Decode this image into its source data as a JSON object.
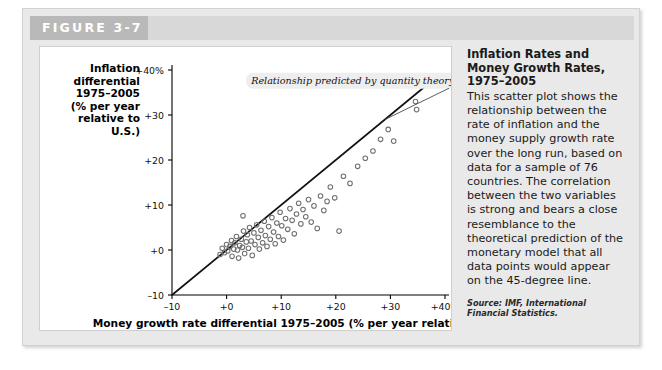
{
  "figure": {
    "tab_label": "FIGURE 3-7"
  },
  "sidebar": {
    "title": "Inflation Rates and Money Growth Rates, 1975–2005",
    "body": "This scatter plot shows the relationship between the rate of inflation and the money supply growth rate over the long run, based on data for a sample of 76 countries. The correlation between the two variables is strong and bears a close resemblance to the theoretical prediction of the monetary model that all data points would appear on the 45-degree line.",
    "source": "Source: IMF, International Financial Statistics."
  },
  "chart_data": {
    "type": "scatter",
    "title": "",
    "xlabel": "Money growth rate differential 1975–2005 (% per year relative to U.S.)",
    "ylabel": "Inflation differential 1975–2005 (% per year relative to U.S.)",
    "ylabel_lines": [
      "Inflation",
      "differential",
      "1975–2005",
      "(% per year",
      "relative to",
      "U.S.)"
    ],
    "xlim": [
      -10,
      40
    ],
    "ylim": [
      -10,
      40
    ],
    "xticks": [
      -10,
      0,
      10,
      20,
      30,
      40
    ],
    "yticks": [
      -10,
      0,
      10,
      20,
      30,
      40
    ],
    "xticklabels": [
      "–10",
      "+0",
      "+10",
      "+20",
      "+30",
      "+40%"
    ],
    "yticklabels": [
      "–10",
      "+0",
      "+10",
      "+20",
      "+30",
      "+40%"
    ],
    "grid": false,
    "legend": null,
    "annotations": [
      {
        "text": "Relationship predicted by quantity theory",
        "x": 4.5,
        "y": 37.5,
        "pointer_to": {
          "x": 29.0,
          "y": 29.0
        }
      }
    ],
    "reference_line": {
      "name": "45-degree line",
      "from": {
        "x": -10,
        "y": -10
      },
      "to": {
        "x": 38,
        "y": 38
      }
    },
    "marker": {
      "shape": "open-circle",
      "radius": 2.3,
      "color": "#6f6f6f"
    },
    "points": [
      {
        "x": -1.2,
        "y": -1.0
      },
      {
        "x": -0.8,
        "y": 0.4
      },
      {
        "x": -0.4,
        "y": -0.6
      },
      {
        "x": 0.0,
        "y": 1.2
      },
      {
        "x": 0.2,
        "y": -0.2
      },
      {
        "x": 0.6,
        "y": 0.8
      },
      {
        "x": 0.9,
        "y": 2.1
      },
      {
        "x": 1.0,
        "y": -1.4
      },
      {
        "x": 1.3,
        "y": 0.2
      },
      {
        "x": 1.5,
        "y": 1.6
      },
      {
        "x": 1.8,
        "y": 3.0
      },
      {
        "x": 2.0,
        "y": 0.0
      },
      {
        "x": 2.2,
        "y": -1.8
      },
      {
        "x": 2.4,
        "y": 1.0
      },
      {
        "x": 2.7,
        "y": 2.4
      },
      {
        "x": 2.9,
        "y": 0.6
      },
      {
        "x": 3.1,
        "y": 4.2
      },
      {
        "x": 3.3,
        "y": -0.8
      },
      {
        "x": 3.6,
        "y": 1.8
      },
      {
        "x": 3.8,
        "y": 3.4
      },
      {
        "x": 4.0,
        "y": 0.4
      },
      {
        "x": 4.2,
        "y": 5.0
      },
      {
        "x": 4.5,
        "y": 2.0
      },
      {
        "x": 4.7,
        "y": -1.2
      },
      {
        "x": 5.0,
        "y": 3.8
      },
      {
        "x": 5.2,
        "y": 1.2
      },
      {
        "x": 3.0,
        "y": 7.6
      },
      {
        "x": 5.5,
        "y": 5.6
      },
      {
        "x": 5.8,
        "y": 2.8
      },
      {
        "x": 6.0,
        "y": 0.2
      },
      {
        "x": 6.3,
        "y": 4.4
      },
      {
        "x": 6.6,
        "y": 1.6
      },
      {
        "x": 6.9,
        "y": 6.4
      },
      {
        "x": 7.1,
        "y": 3.2
      },
      {
        "x": 7.4,
        "y": 0.8
      },
      {
        "x": 7.7,
        "y": 5.2
      },
      {
        "x": 8.0,
        "y": 2.4
      },
      {
        "x": 8.3,
        "y": 7.2
      },
      {
        "x": 8.6,
        "y": 4.0
      },
      {
        "x": 8.9,
        "y": 1.4
      },
      {
        "x": 9.2,
        "y": 6.0
      },
      {
        "x": 9.5,
        "y": 3.0
      },
      {
        "x": 9.8,
        "y": 8.4
      },
      {
        "x": 10.1,
        "y": 5.4
      },
      {
        "x": 10.4,
        "y": 2.2
      },
      {
        "x": 10.8,
        "y": 7.0
      },
      {
        "x": 11.2,
        "y": 4.6
      },
      {
        "x": 11.6,
        "y": 9.2
      },
      {
        "x": 12.0,
        "y": 6.6
      },
      {
        "x": 12.4,
        "y": 3.6
      },
      {
        "x": 12.8,
        "y": 8.0
      },
      {
        "x": 13.2,
        "y": 10.4
      },
      {
        "x": 13.6,
        "y": 5.8
      },
      {
        "x": 14.0,
        "y": 9.0
      },
      {
        "x": 14.5,
        "y": 7.4
      },
      {
        "x": 15.0,
        "y": 11.2
      },
      {
        "x": 15.5,
        "y": 6.2
      },
      {
        "x": 16.0,
        "y": 9.8
      },
      {
        "x": 16.6,
        "y": 4.8
      },
      {
        "x": 17.2,
        "y": 12.0
      },
      {
        "x": 17.8,
        "y": 8.8
      },
      {
        "x": 18.4,
        "y": 10.8
      },
      {
        "x": 19.0,
        "y": 14.0
      },
      {
        "x": 19.8,
        "y": 11.6
      },
      {
        "x": 20.6,
        "y": 4.2
      },
      {
        "x": 21.4,
        "y": 16.4
      },
      {
        "x": 22.6,
        "y": 14.8
      },
      {
        "x": 24.0,
        "y": 18.6
      },
      {
        "x": 25.4,
        "y": 20.4
      },
      {
        "x": 26.8,
        "y": 22.0
      },
      {
        "x": 28.2,
        "y": 24.6
      },
      {
        "x": 29.6,
        "y": 26.8
      },
      {
        "x": 30.6,
        "y": 24.2
      },
      {
        "x": 34.6,
        "y": 33.0
      },
      {
        "x": 34.8,
        "y": 31.2
      }
    ]
  }
}
